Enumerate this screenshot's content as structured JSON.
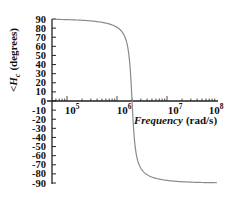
{
  "chart_data": {
    "type": "line",
    "title": "",
    "xlabel": "Frequency (rad/s)",
    "xlabel_italic_part": "Frequency",
    "xlabel_unit_part": "(rad/s)",
    "ylabel": "∠H_c (degrees)",
    "ylabel_symbol": "<H",
    "ylabel_subscript": "c",
    "ylabel_unit": "(degrees)",
    "xscale": "log",
    "xlim": [
      50000,
      100000000
    ],
    "ylim": [
      -90,
      90
    ],
    "grid": false,
    "legend": "none",
    "x_tick_labels": [
      {
        "base": "10",
        "exp": "5",
        "value": 100000
      },
      {
        "base": "10",
        "exp": "6",
        "value": 1000000
      },
      {
        "base": "10",
        "exp": "7",
        "value": 10000000
      },
      {
        "base": "10",
        "exp": "8",
        "value": 100000000
      }
    ],
    "y_tick_labels": [
      "90",
      "80",
      "70",
      "60",
      "50",
      "40",
      "30",
      "20",
      "10",
      "0",
      "-10",
      "-20",
      "-30",
      "-40",
      "-50",
      "-60",
      "-70",
      "-80",
      "-90"
    ],
    "series": [
      {
        "name": "phase",
        "color": "#8a8a8a",
        "x": [
          50000,
          100000,
          200000,
          500000,
          1000000,
          1500000,
          1800000,
          2000000,
          2200000,
          2600000,
          3000000,
          5000000,
          10000000,
          30000000,
          100000000
        ],
        "y": [
          89,
          88,
          86,
          80,
          62,
          30,
          10,
          0,
          -10,
          -30,
          -50,
          -78,
          -86,
          -89,
          -90
        ]
      }
    ]
  }
}
